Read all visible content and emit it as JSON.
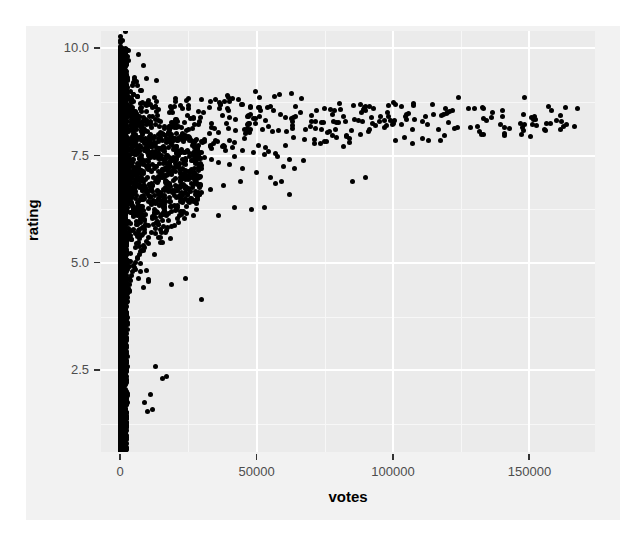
{
  "chart_data": {
    "type": "scatter",
    "title": "",
    "xlabel": "votes",
    "ylabel": "rating",
    "xlim": [
      -7000,
      174000
    ],
    "ylim": [
      0.6,
      10.4
    ],
    "grid": true,
    "legend": null,
    "x_ticks": [
      {
        "value": 0,
        "label": "0"
      },
      {
        "value": 50000,
        "label": "50000"
      },
      {
        "value": 100000,
        "label": "100000"
      },
      {
        "value": 150000,
        "label": "150000"
      }
    ],
    "y_ticks": [
      {
        "value": 2.5,
        "label": "2.5"
      },
      {
        "value": 5.0,
        "label": "5.0"
      },
      {
        "value": 7.5,
        "label": "7.5"
      },
      {
        "value": 10.0,
        "label": "10.0"
      }
    ],
    "x_minor_ticks": [
      25000,
      75000,
      125000
    ],
    "y_minor_ticks": [
      1.25,
      3.75,
      6.25,
      8.75
    ],
    "point_color": "#000000",
    "point_size": 5,
    "panel_background": "#ebebeb",
    "figure_background": "#f2f2f2",
    "gridline_color": "#ffffff",
    "points": [
      [
        120,
        9.95
      ],
      [
        180,
        9.9
      ],
      [
        150,
        9.85
      ],
      [
        210,
        9.8
      ],
      [
        140,
        9.75
      ],
      [
        260,
        9.7
      ],
      [
        190,
        9.65
      ],
      [
        320,
        9.6
      ],
      [
        170,
        9.55
      ],
      [
        240,
        9.5
      ],
      [
        300,
        9.45
      ],
      [
        150,
        9.4
      ],
      [
        380,
        9.35
      ],
      [
        220,
        9.3
      ],
      [
        410,
        9.25
      ],
      [
        290,
        9.2
      ],
      [
        520,
        9.15
      ],
      [
        330,
        9.1
      ],
      [
        640,
        9.05
      ],
      [
        270,
        9.0
      ],
      [
        880,
        8.95
      ],
      [
        450,
        8.9
      ],
      [
        1200,
        8.85
      ],
      [
        610,
        8.8
      ],
      [
        1600,
        8.78
      ],
      [
        700,
        8.75
      ],
      [
        2100,
        8.72
      ],
      [
        920,
        8.7
      ],
      [
        2800,
        8.68
      ],
      [
        1300,
        8.65
      ],
      [
        3500,
        8.62
      ],
      [
        1750,
        8.6
      ],
      [
        4300,
        8.58
      ],
      [
        2200,
        8.55
      ],
      [
        5200,
        8.52
      ],
      [
        2700,
        8.5
      ],
      [
        6100,
        8.48
      ],
      [
        3200,
        8.45
      ],
      [
        7200,
        8.42
      ],
      [
        3900,
        8.4
      ],
      [
        8400,
        8.38
      ],
      [
        4600,
        8.35
      ],
      [
        9800,
        8.32
      ],
      [
        5400,
        8.3
      ],
      [
        11200,
        8.28
      ],
      [
        6300,
        8.25
      ],
      [
        12800,
        8.22
      ],
      [
        7100,
        8.2
      ],
      [
        14500,
        8.18
      ],
      [
        8000,
        8.15
      ],
      [
        16300,
        8.12
      ],
      [
        9000,
        8.1
      ],
      [
        18200,
        8.08
      ],
      [
        10000,
        8.05
      ],
      [
        20500,
        8.02
      ],
      [
        11200,
        8.0
      ],
      [
        22800,
        7.98
      ],
      [
        12500,
        7.95
      ],
      [
        25300,
        7.92
      ],
      [
        13900,
        7.9
      ],
      [
        28100,
        7.88
      ],
      [
        15400,
        7.85
      ],
      [
        31000,
        7.82
      ],
      [
        17000,
        7.8
      ],
      [
        34200,
        7.78
      ],
      [
        18700,
        7.75
      ],
      [
        37500,
        7.72
      ],
      [
        20500,
        7.7
      ],
      [
        41000,
        7.68
      ],
      [
        22400,
        7.65
      ],
      [
        44800,
        7.62
      ],
      [
        24400,
        7.6
      ],
      [
        48800,
        7.58
      ],
      [
        26500,
        7.55
      ],
      [
        53000,
        7.52
      ],
      [
        28700,
        7.5
      ],
      [
        57500,
        7.48
      ],
      [
        31000,
        7.45
      ],
      [
        62200,
        7.42
      ],
      [
        33400,
        7.4
      ],
      [
        67200,
        7.38
      ],
      [
        35900,
        7.35
      ],
      [
        40000,
        7.3
      ],
      [
        45000,
        7.2
      ],
      [
        50000,
        7.1
      ],
      [
        55000,
        7.0
      ],
      [
        44000,
        6.9
      ],
      [
        38000,
        6.8
      ],
      [
        33000,
        6.7
      ],
      [
        29000,
        6.6
      ],
      [
        26000,
        6.5
      ],
      [
        23000,
        6.4
      ],
      [
        21000,
        6.3
      ],
      [
        19000,
        6.2
      ],
      [
        17000,
        6.1
      ],
      [
        15500,
        6.0
      ],
      [
        14000,
        5.9
      ],
      [
        12800,
        5.8
      ],
      [
        11600,
        5.7
      ],
      [
        10500,
        5.6
      ],
      [
        9500,
        5.5
      ],
      [
        8600,
        5.4
      ],
      [
        7800,
        5.3
      ],
      [
        7000,
        5.2
      ],
      [
        6300,
        5.1
      ],
      [
        5700,
        5.0
      ],
      [
        5100,
        4.9
      ],
      [
        4600,
        4.8
      ],
      [
        4100,
        4.7
      ],
      [
        3700,
        4.6
      ],
      [
        3300,
        4.5
      ],
      [
        2900,
        4.4
      ],
      [
        2600,
        4.3
      ],
      [
        2300,
        4.2
      ],
      [
        2000,
        4.1
      ],
      [
        1800,
        4.0
      ],
      [
        1600,
        3.9
      ],
      [
        1400,
        3.8
      ],
      [
        1200,
        3.7
      ],
      [
        1050,
        3.6
      ],
      [
        900,
        3.5
      ],
      [
        780,
        3.4
      ],
      [
        670,
        3.3
      ],
      [
        570,
        3.2
      ],
      [
        490,
        3.1
      ],
      [
        420,
        3.0
      ],
      [
        360,
        2.9
      ],
      [
        300,
        2.8
      ],
      [
        260,
        2.7
      ],
      [
        220,
        2.6
      ],
      [
        190,
        2.5
      ],
      [
        160,
        2.4
      ],
      [
        140,
        2.3
      ],
      [
        120,
        2.2
      ],
      [
        100,
        2.1
      ],
      [
        90,
        2.0
      ],
      [
        80,
        1.9
      ],
      [
        70,
        1.8
      ],
      [
        60,
        1.7
      ],
      [
        55,
        1.6
      ],
      [
        50,
        1.5
      ],
      [
        45,
        1.4
      ],
      [
        40,
        1.3
      ],
      [
        35,
        1.2
      ],
      [
        30,
        1.1
      ],
      [
        28,
        1.0
      ],
      [
        75000,
        8.6
      ],
      [
        78000,
        8.45
      ],
      [
        82000,
        8.4
      ],
      [
        86000,
        8.35
      ],
      [
        90000,
        8.55
      ],
      [
        93000,
        8.6
      ],
      [
        95000,
        8.3
      ],
      [
        98000,
        8.5
      ],
      [
        101000,
        8.7
      ],
      [
        103000,
        8.65
      ],
      [
        105000,
        8.45
      ],
      [
        108000,
        8.35
      ],
      [
        112000,
        8.4
      ],
      [
        115000,
        8.45
      ],
      [
        120000,
        8.5
      ],
      [
        124000,
        8.85
      ],
      [
        130000,
        8.6
      ],
      [
        133000,
        8.6
      ],
      [
        140000,
        8.4
      ],
      [
        148000,
        8.85
      ],
      [
        158000,
        8.55
      ],
      [
        85000,
        6.9
      ],
      [
        90000,
        7.0
      ],
      [
        62000,
        6.6
      ],
      [
        60000,
        7.25
      ],
      [
        64000,
        7.2
      ],
      [
        57000,
        6.85
      ],
      [
        59000,
        6.9
      ],
      [
        53000,
        6.3
      ],
      [
        48000,
        6.25
      ],
      [
        42000,
        6.3
      ],
      [
        36000,
        6.1
      ],
      [
        30000,
        4.15
      ],
      [
        24000,
        4.65
      ],
      [
        19000,
        4.5
      ],
      [
        17000,
        2.35
      ],
      [
        15500,
        2.3
      ],
      [
        13000,
        2.6
      ],
      [
        11000,
        1.95
      ],
      [
        9000,
        1.75
      ],
      [
        10000,
        1.55
      ],
      [
        12000,
        1.6
      ],
      [
        70000,
        8.3
      ],
      [
        72000,
        8.55
      ],
      [
        66000,
        8.5
      ],
      [
        68000,
        8.1
      ],
      [
        55000,
        8.65
      ],
      [
        45000,
        8.7
      ],
      [
        40000,
        8.75
      ],
      [
        35000,
        8.8
      ],
      [
        30000,
        8.8
      ],
      [
        25000,
        8.6
      ],
      [
        20000,
        8.65
      ],
      [
        18000,
        8.5
      ]
    ]
  },
  "axis": {
    "x_title": "votes",
    "y_title": "rating"
  }
}
